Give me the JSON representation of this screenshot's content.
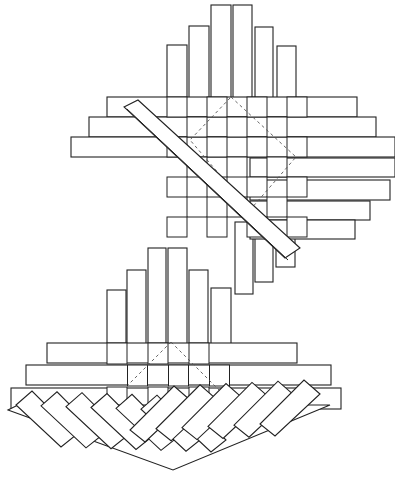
{
  "diagram": {
    "title": "",
    "colors": {
      "line": "#222222",
      "fold_line": "#555555",
      "background": "#ffffff"
    },
    "upper_weave": {
      "vertical_strips": [
        {
          "x": 167,
          "y": 45,
          "w": 20,
          "h": 75
        },
        {
          "x": 189,
          "y": 26,
          "w": 20,
          "h": 94
        },
        {
          "x": 211,
          "y": 5,
          "w": 20,
          "h": 115
        },
        {
          "x": 233,
          "y": 5,
          "w": 19,
          "h": 115
        },
        {
          "x": 255,
          "y": 27,
          "w": 18,
          "h": 93
        },
        {
          "x": 277,
          "y": 46,
          "w": 19,
          "h": 74
        }
      ],
      "horizontal_strips": [
        {
          "x": 107,
          "y": 97,
          "w": 250,
          "h": 20
        },
        {
          "x": 89,
          "y": 117,
          "w": 287,
          "h": 20
        },
        {
          "x": 71,
          "y": 137,
          "w": 324,
          "h": 20
        },
        {
          "x": 250,
          "y": 158,
          "w": 145,
          "h": 19
        },
        {
          "x": 250,
          "y": 180,
          "w": 140,
          "h": 20
        },
        {
          "x": 250,
          "y": 201,
          "w": 120,
          "h": 19
        },
        {
          "x": 250,
          "y": 220,
          "w": 105,
          "h": 19
        }
      ],
      "lower_vertical_strips": [
        {
          "x": 235,
          "y": 222,
          "w": 18,
          "h": 72
        },
        {
          "x": 255,
          "y": 222,
          "w": 18,
          "h": 60
        },
        {
          "x": 276,
          "y": 222,
          "w": 19,
          "h": 45
        }
      ],
      "fold_square": [
        [
          231,
          97
        ],
        [
          296,
          157
        ],
        [
          250,
          210
        ],
        [
          190,
          140
        ]
      ],
      "diagonal_strip": [
        [
          124,
          107
        ],
        [
          138,
          100
        ],
        [
          300,
          248
        ],
        [
          285,
          258
        ]
      ]
    },
    "lower_weave": {
      "vertical_strips": [
        {
          "x": 107,
          "y": 290,
          "w": 19,
          "h": 60
        },
        {
          "x": 127,
          "y": 270,
          "w": 19,
          "h": 80
        },
        {
          "x": 148,
          "y": 248,
          "w": 18,
          "h": 102
        },
        {
          "x": 168,
          "y": 248,
          "w": 19,
          "h": 102
        },
        {
          "x": 189,
          "y": 270,
          "w": 19,
          "h": 80
        },
        {
          "x": 211,
          "y": 288,
          "w": 20,
          "h": 62
        }
      ],
      "horizontal_strips": [
        {
          "x": 47,
          "y": 343,
          "w": 250,
          "h": 20
        },
        {
          "x": 26,
          "y": 365,
          "w": 305,
          "h": 20
        },
        {
          "x": 11,
          "y": 388,
          "w": 330,
          "h": 21
        }
      ],
      "fold_lines": [
        [
          [
            171,
            342
          ],
          [
            128,
            385
          ]
        ],
        [
          [
            171,
            342
          ],
          [
            222,
            393
          ]
        ]
      ],
      "fan_apex": [
        173,
        470
      ],
      "fan_left": [
        8,
        410
      ],
      "fan_right": [
        330,
        405
      ]
    }
  }
}
